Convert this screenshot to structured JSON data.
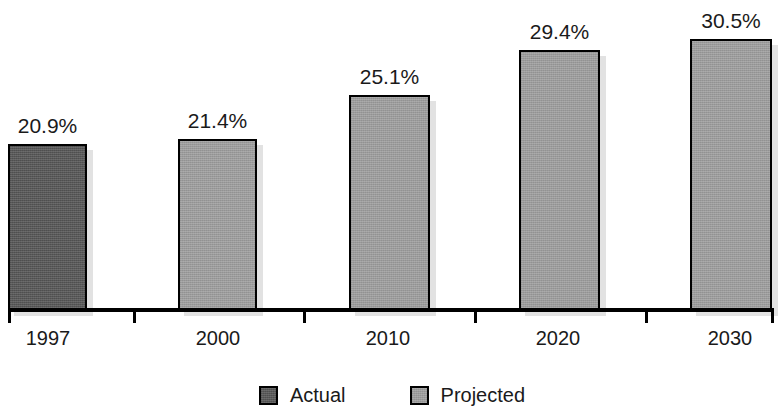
{
  "chart_data": {
    "type": "bar",
    "title": "",
    "subtitle": "",
    "xlabel": "",
    "ylabel": "",
    "grid": false,
    "ylim": [
      0,
      33.5
    ],
    "axis_visible": {
      "x": true,
      "y": false
    },
    "categories": [
      "1997",
      "2000",
      "2010",
      "2020",
      "2030"
    ],
    "values": [
      20.9,
      21.4,
      25.1,
      29.4,
      30.5
    ],
    "data_labels": [
      "20.9%",
      "21.4%",
      "25.1%",
      "29.4%",
      "30.5%"
    ],
    "bar_series": [
      "Actual",
      "Projected",
      "Projected",
      "Projected",
      "Projected"
    ],
    "legend": {
      "position": "bottom-center",
      "entries": [
        {
          "label": "Actual",
          "color": "#585858",
          "swatch": "legend-swatch-actual"
        },
        {
          "label": "Projected",
          "color": "#9b9b9b",
          "swatch": "legend-swatch-projected"
        }
      ]
    },
    "colors": {
      "actual": "#585858",
      "projected": "#9b9b9b",
      "bar_border": "#000000",
      "bar_shadow": "#e2e2e2",
      "axis": "#000000",
      "text": "#1a1a1a",
      "background": "#ffffff"
    }
  },
  "bars": [
    {
      "category": "1997",
      "value": 20.9,
      "label": "20.9%",
      "series": "Actual",
      "left": 8,
      "width": 79,
      "height": 166
    },
    {
      "category": "2000",
      "value": 21.4,
      "label": "21.4%",
      "series": "Projected",
      "left": 178,
      "width": 79,
      "height": 171
    },
    {
      "category": "2010",
      "value": 25.1,
      "label": "25.1%",
      "series": "Projected",
      "left": 349,
      "width": 81,
      "height": 215
    },
    {
      "category": "2020",
      "value": 29.4,
      "label": "29.4%",
      "series": "Projected",
      "left": 519,
      "width": 81,
      "height": 260
    },
    {
      "category": "2030",
      "value": 30.5,
      "label": "30.5%",
      "series": "Projected",
      "left": 690,
      "width": 82,
      "height": 271
    }
  ],
  "axis": {
    "ticks": [
      {
        "label": "1997",
        "tick_x": 8,
        "label_x": 48
      },
      {
        "label": "2000",
        "tick_x": 133,
        "label_x": 218
      },
      {
        "label": "2010",
        "tick_x": 303,
        "label_x": 388
      },
      {
        "label": "2020",
        "tick_x": 474,
        "label_x": 558
      },
      {
        "label": "2030",
        "tick_x": 645,
        "label_x": 730
      },
      {
        "label": "",
        "tick_x": 771,
        "label_x": -100
      }
    ]
  },
  "legend": {
    "items": [
      {
        "label": "Actual",
        "variant": "actual"
      },
      {
        "label": "Projected",
        "variant": "projected"
      }
    ]
  }
}
